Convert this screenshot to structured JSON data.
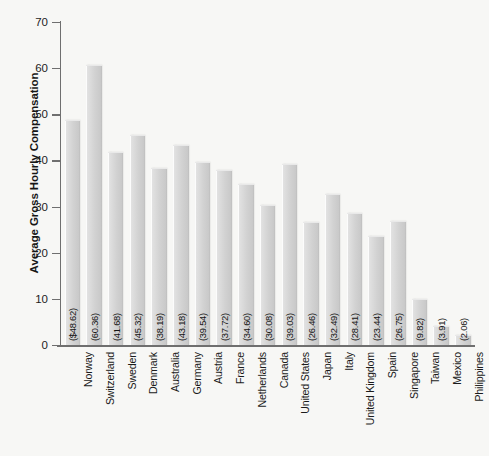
{
  "chart_data": {
    "type": "bar",
    "title": "",
    "xlabel": "",
    "ylabel": "Average Gross Hourly Compensation",
    "ylim": [
      0,
      70
    ],
    "yticks": [
      0,
      10,
      20,
      30,
      40,
      50,
      60,
      70
    ],
    "grid": false,
    "legend": null,
    "categories": [
      "Norway",
      "Switzerland",
      "Sweden",
      "Denmark",
      "Australia",
      "Germany",
      "Austria",
      "France",
      "Netherlands",
      "Canada",
      "United States",
      "Japan",
      "Italy",
      "United Kingdom",
      "Spain",
      "Singapore",
      "Taiwan",
      "Mexico",
      "Philippines"
    ],
    "values": [
      48.62,
      60.36,
      41.68,
      45.32,
      38.19,
      43.18,
      39.54,
      37.72,
      34.6,
      30.08,
      39.03,
      26.46,
      32.49,
      28.41,
      23.44,
      26.75,
      9.82,
      3.91,
      2.06
    ],
    "value_labels": [
      "($48.62)",
      "(60.36)",
      "(41.68)",
      "(45.32)",
      "(38.19)",
      "(43.18)",
      "(39.54)",
      "(37.72)",
      "(34.60)",
      "(30.08)",
      "(39.03)",
      "(26.46)",
      "(32.49)",
      "(28.41)",
      "(23.44)",
      "(26.75)",
      "(9.82)",
      "(3.91)",
      "(2.06)"
    ],
    "colors": {
      "bar_fill": "#d2d2d2",
      "bar_highlight": "#fcfcfc",
      "bar_shadow": "#bdbdbd",
      "axis": "#6f6f6f",
      "text": "#161616",
      "background": "#f7f7f5"
    }
  }
}
